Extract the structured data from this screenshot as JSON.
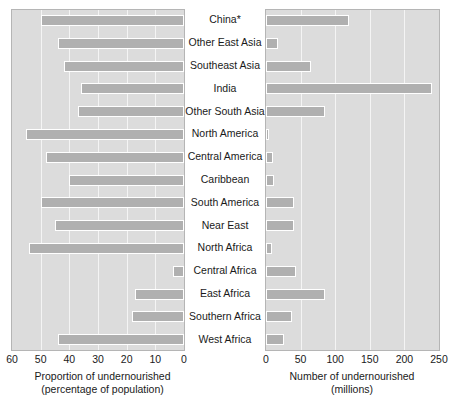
{
  "chart_data": {
    "type": "bar",
    "title": "",
    "subtitle": "",
    "orientation": "horizontal",
    "layout": "two-panel back-to-back (butterfly) bar chart with centred category labels",
    "grid": true,
    "legend": null,
    "categories": [
      "China*",
      "Other East Asia",
      "Southeast Asia",
      "India",
      "Other South Asia",
      "North America",
      "Central America",
      "Caribbean",
      "South America",
      "Near East",
      "North Africa",
      "Central Africa",
      "East Africa",
      "Southern Africa",
      "West Africa"
    ],
    "panels": [
      {
        "id": "proportion",
        "position": "left",
        "xlabel_line1": "Proportion of undernourished",
        "xlabel_line2": "(percentage of population)",
        "xlim": [
          60,
          0
        ],
        "axis_direction": "reversed",
        "tick_values": [
          60,
          50,
          40,
          30,
          20,
          10,
          0
        ],
        "tick_labels": [
          "60",
          "50",
          "40",
          "30",
          "20",
          "10",
          "0"
        ],
        "units": "percent",
        "values": [
          10,
          16,
          18,
          24,
          23,
          5,
          12,
          20,
          10,
          15,
          6,
          56,
          43,
          42,
          16
        ]
      },
      {
        "id": "number",
        "position": "right",
        "xlabel_line1": "Number of undernourished",
        "xlabel_line2": "(millions)",
        "xlim": [
          0,
          250
        ],
        "axis_direction": "normal",
        "tick_values": [
          0,
          50,
          100,
          150,
          200,
          250
        ],
        "tick_labels": [
          "0",
          "50",
          "100",
          "150",
          "200",
          "250"
        ],
        "units": "millions",
        "values": [
          120,
          18,
          65,
          240,
          85,
          5,
          10,
          12,
          40,
          40,
          8,
          43,
          85,
          38,
          26
        ]
      }
    ],
    "footnote_marker": "*",
    "colors": {
      "bar_fill": "#b0b0b0",
      "bar_outline": "#ffffff",
      "panel_background": "#dcdcdc",
      "panel_border": "#b5b5b5",
      "gridline": "#f4f4f4",
      "text": "#1a1a1a",
      "page_background": "#ffffff"
    }
  }
}
